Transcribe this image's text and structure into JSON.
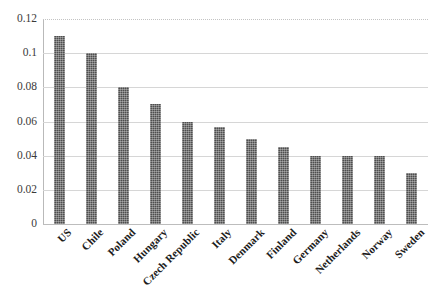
{
  "chart_data": {
    "type": "bar",
    "title": "",
    "subtitle": "",
    "xlabel": "",
    "ylabel": "",
    "categories": [
      "US",
      "Chile",
      "Poland",
      "Hungary",
      "Czech Republic",
      "Italy",
      "Denmark",
      "Finland",
      "Germany",
      "Netherlands",
      "Norway",
      "Sweden"
    ],
    "values": [
      0.11,
      0.1,
      0.08,
      0.07,
      0.06,
      0.057,
      0.05,
      0.045,
      0.04,
      0.04,
      0.04,
      0.03
    ],
    "ylim": [
      0,
      0.12
    ],
    "yticks": [
      0,
      0.02,
      0.04,
      0.06,
      0.08,
      0.1,
      0.12
    ],
    "ytick_labels": [
      "0",
      "0.02",
      "0.04",
      "0.06",
      "0.08",
      "0.1",
      "0.12"
    ],
    "grid": true,
    "grid_axis": "y",
    "legend": false,
    "legend_position": "none",
    "bar_color": "#4e4e4e",
    "bar_pattern": "dotted-texture",
    "gridline_color": "#d6d6d6",
    "axis_color": "#b9b9b9",
    "background_color": "#ffffff",
    "xtick_rotation": -45
  }
}
